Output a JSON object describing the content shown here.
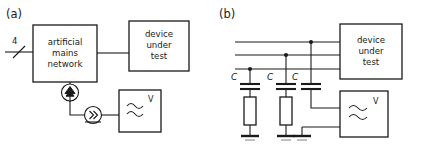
{
  "figure": {
    "panels": [
      {
        "id": "a",
        "label": "(a)",
        "bus_count_label": "4",
        "blocks": [
          {
            "name": "artificial-mains-network",
            "lines": [
              "artificial",
              "mains",
              "network"
            ]
          },
          {
            "name": "device-under-test",
            "lines": [
              "device",
              "under",
              "test"
            ]
          }
        ],
        "symbols": [
          {
            "name": "coupling-probe-icon",
            "type": "circle-chevron-up"
          },
          {
            "name": "amplifier-icon",
            "type": "circle-chevron-right"
          },
          {
            "name": "measuring-receiver",
            "type": "wave-box",
            "unit": "V"
          }
        ]
      },
      {
        "id": "b",
        "label": "(b)",
        "blocks": [
          {
            "name": "device-under-test",
            "lines": [
              "device",
              "under",
              "test"
            ]
          }
        ],
        "capacitors": [
          {
            "name": "coupling-capacitor-1",
            "label": "C"
          },
          {
            "name": "coupling-capacitor-2",
            "label": "C"
          },
          {
            "name": "coupling-capacitor-3",
            "label": "C"
          }
        ],
        "resistors": [
          {
            "name": "terminating-resistor-1"
          },
          {
            "name": "terminating-resistor-2"
          }
        ],
        "grounds": [
          {
            "name": "ground-symbol-1"
          },
          {
            "name": "ground-symbol-2"
          },
          {
            "name": "ground-symbol-3"
          }
        ],
        "symbols": [
          {
            "name": "measuring-receiver",
            "type": "wave-box",
            "unit": "V"
          }
        ]
      }
    ],
    "text": {
      "panel_a_label": "(a)",
      "panel_b_label": "(b)",
      "bus_label": "4",
      "amn_line1": "artificial",
      "amn_line2": "mains",
      "amn_line3": "network",
      "dut_line1": "device",
      "dut_line2": "under",
      "dut_line3": "test",
      "dut_b_line1": "device",
      "dut_b_line2": "under",
      "dut_b_line3": "test",
      "cap_label_1": "C",
      "cap_label_2": "C",
      "cap_label_3": "C",
      "receiver_unit_a": "V",
      "receiver_unit_b": "V"
    },
    "colors": {
      "ink": "#1a1a1a",
      "paper": "#ffffff"
    }
  }
}
